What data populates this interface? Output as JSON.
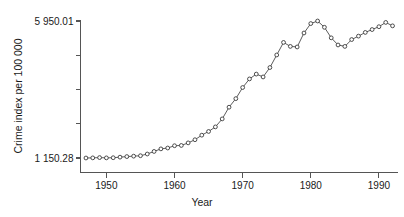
{
  "chart_data": {
    "type": "line",
    "title": "",
    "subtitle": "",
    "xlabel": "Year",
    "ylabel": "Crime index per 100 000",
    "grid": false,
    "legend": null,
    "legend_position": "none",
    "marker": "open-circle",
    "xlim": [
      1946.2,
      1992.8
    ],
    "ylim": [
      1150.28,
      5950.01
    ],
    "xticks": [
      1950,
      1960,
      1970,
      1980,
      1990
    ],
    "xtick_labels": [
      "1950",
      "1960",
      "1970",
      "1980",
      "1990"
    ],
    "yticks": [
      1150.28,
      2350.21,
      3550.15,
      4750.08,
      5950.01
    ],
    "ytick_labels": [
      "1 150.28",
      "",
      "",
      "",
      "5 950.01"
    ],
    "ytick_label_top": "5 950.01",
    "ytick_label_bottom": "1 150.28",
    "x": [
      1947,
      1948,
      1949,
      1950,
      1951,
      1952,
      1953,
      1954,
      1955,
      1956,
      1957,
      1958,
      1959,
      1960,
      1961,
      1962,
      1963,
      1964,
      1965,
      1966,
      1967,
      1968,
      1969,
      1970,
      1971,
      1972,
      1973,
      1974,
      1975,
      1976,
      1977,
      1978,
      1979,
      1980,
      1981,
      1982,
      1983,
      1984,
      1985,
      1986,
      1987,
      1988,
      1989,
      1990,
      1991,
      1992
    ],
    "values": [
      1150.28,
      1155.0,
      1165.0,
      1155.0,
      1160.0,
      1180.0,
      1200.0,
      1215.0,
      1230.0,
      1290.0,
      1380.0,
      1470.0,
      1500.0,
      1580.0,
      1590.0,
      1680.0,
      1790.0,
      1950.0,
      2080.0,
      2240.0,
      2520.0,
      2930.0,
      3230.0,
      3620.0,
      3920.0,
      4090.0,
      3990.0,
      4320.0,
      4760.0,
      5200.0,
      5060.0,
      5040.0,
      5530.0,
      5860.0,
      5950.01,
      5730.0,
      5360.0,
      5110.0,
      5060.0,
      5300.0,
      5420.0,
      5550.0,
      5650.0,
      5750.0,
      5900.0,
      5780.0
    ]
  },
  "axes": {
    "y_axis_title": "Crime index per 100 000",
    "x_axis_title": "Year"
  }
}
